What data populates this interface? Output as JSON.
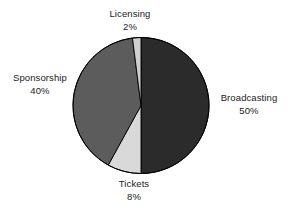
{
  "chart_data": {
    "type": "pie",
    "title": "",
    "subtitle": "",
    "xlabel": "",
    "ylabel": "",
    "legend": "none",
    "grid": false,
    "units": "percent",
    "start_angle_deg": 0,
    "direction": "clockwise",
    "categories": [
      "Broadcasting",
      "Tickets",
      "Sponsorship",
      "Licensing"
    ],
    "values": [
      50,
      8,
      40,
      2
    ],
    "slices": [
      {
        "label": "Broadcasting",
        "value": 50,
        "value_text": "50%",
        "color": "#2b2b2b",
        "start_deg": 0,
        "end_deg": 180
      },
      {
        "label": "Tickets",
        "value": 8,
        "value_text": "8%",
        "color": "#d9d9d9",
        "start_deg": 180,
        "end_deg": 208.8
      },
      {
        "label": "Sponsorship",
        "value": 40,
        "value_text": "40%",
        "color": "#5c5c5c",
        "start_deg": 208.8,
        "end_deg": 352.8
      },
      {
        "label": "Licensing",
        "value": 2,
        "value_text": "2%",
        "color": "#cfcfcf",
        "start_deg": 352.8,
        "end_deg": 360
      }
    ],
    "labels": {
      "licensing": {
        "name": "Licensing",
        "value_text": "2%"
      },
      "broadcasting": {
        "name": "Broadcasting",
        "value_text": "50%"
      },
      "sponsorship": {
        "name": "Sponsorship",
        "value_text": "40%"
      },
      "tickets": {
        "name": "Tickets",
        "value_text": "8%"
      }
    },
    "geometry": {
      "center_x": 141,
      "center_y": 105.5,
      "radius": 68
    },
    "style": {
      "background": "#ffffff",
      "outline": "#000000",
      "label_color": "#1a1a1a"
    }
  }
}
